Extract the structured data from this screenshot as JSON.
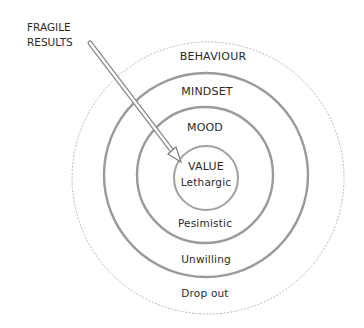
{
  "annotation": {
    "line1": "FRAGILE",
    "line2": "RESULTS"
  },
  "rings": [
    {
      "label": "BEHAVIOUR",
      "outcome": "Drop out"
    },
    {
      "label": "MINDSET",
      "outcome": "Unwilling"
    },
    {
      "label": "MOOD",
      "outcome": "Pesimistic"
    },
    {
      "label": "VALUE",
      "outcome": "Lethargic"
    }
  ],
  "colors": {
    "ring_stroke": "#9a9a9a",
    "outer_ring_stroke": "#b5b5b5",
    "arrow_stroke": "#8a8a8a",
    "text": "#2a2a2a"
  }
}
